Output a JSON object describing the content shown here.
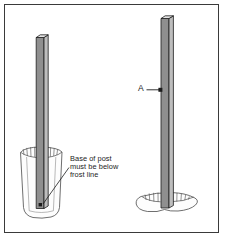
{
  "figure": {
    "type": "technical-line-illustration",
    "frame": {
      "visible": true,
      "color": "#3a3a3a"
    },
    "background": "#ffffff"
  },
  "annotations": {
    "frost_note": {
      "lines": [
        "Base of post",
        "must be below",
        "frost line"
      ],
      "full_text": "Base of post must be below frost line",
      "leader": "line-with-dot-terminator",
      "points_to": "base-of-left-post"
    },
    "callout_a": {
      "label": "A",
      "leader": "line-with-dot-terminator",
      "points_to": "right-post-face"
    }
  },
  "objects": {
    "left_post": {
      "name": "post-set-below-frost-line",
      "face_front_color": "#8f8f8f",
      "face_side_color": "#bdbdbd",
      "outline_color": "#1c1c1c"
    },
    "left_hole": {
      "name": "deep-post-hole",
      "rim_hatching": true,
      "fill_color": "#fdfdfd",
      "outline_color": "#555555"
    },
    "right_post": {
      "name": "post-set-in-shallow-hole",
      "face_front_color": "#8f8f8f",
      "face_side_color": "#bdbdbd",
      "outline_color": "#1c1c1c"
    },
    "right_hole": {
      "name": "shallow-ground-hole",
      "rim_hatching": true,
      "fill_color": "#fdfdfd",
      "outline_color": "#555555"
    }
  }
}
